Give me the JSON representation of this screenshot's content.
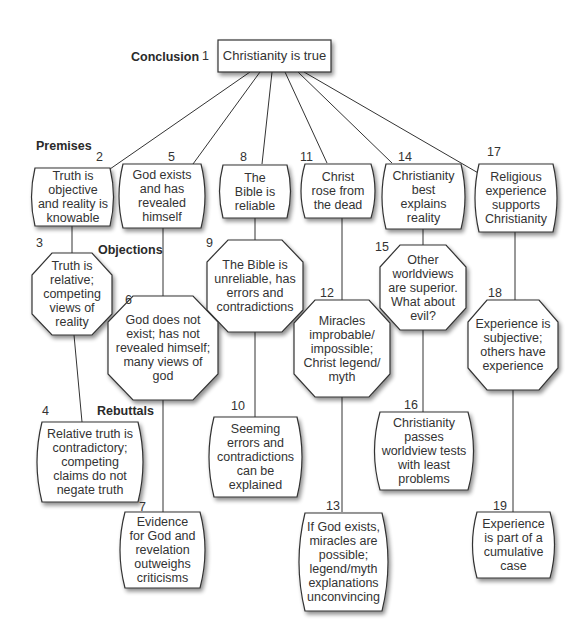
{
  "sections": {
    "conclusion": "Conclusion",
    "premises": "Premises",
    "objections": "Objections",
    "rebuttals": "Rebuttals"
  },
  "nodes": {
    "n1": {
      "number": "1",
      "type": "conclusion",
      "text": "Christianity is true"
    },
    "n2": {
      "number": "2",
      "type": "premise",
      "text": "Truth is objective and reality is knowable"
    },
    "n3": {
      "number": "3",
      "type": "objection",
      "text": "Truth is relative; competing views of reality"
    },
    "n4": {
      "number": "4",
      "type": "rebuttal",
      "text": "Relative truth is contradictory; competing claims do not negate truth"
    },
    "n5": {
      "number": "5",
      "type": "premise",
      "text": "God exists and has revealed himself"
    },
    "n6": {
      "number": "6",
      "type": "objection",
      "text": "God does not exist; has not revealed himself; many views of god"
    },
    "n7": {
      "number": "7",
      "type": "rebuttal",
      "text": "Evidence for God and revelation outweighs criticisms"
    },
    "n8": {
      "number": "8",
      "type": "premise",
      "text": "The Bible is reliable"
    },
    "n9": {
      "number": "9",
      "type": "objection",
      "text": "The Bible is unreliable, has errors and contradictions"
    },
    "n10": {
      "number": "10",
      "type": "rebuttal",
      "text": "Seeming errors and contradictions can be explained"
    },
    "n11": {
      "number": "11",
      "type": "premise",
      "text": "Christ rose from the dead"
    },
    "n12": {
      "number": "12",
      "type": "objection",
      "text": "Miracles improbable/ impossible; Christ legend/ myth"
    },
    "n13": {
      "number": "13",
      "type": "rebuttal",
      "text": "If God exists, miracles are possible; legend/myth explanations unconvincing"
    },
    "n14": {
      "number": "14",
      "type": "premise",
      "text": "Christianity best explains reality"
    },
    "n15": {
      "number": "15",
      "type": "objection",
      "text": "Other worldviews are superior. What about evil?"
    },
    "n16": {
      "number": "16",
      "type": "rebuttal",
      "text": "Christianity passes worldview tests with least problems"
    },
    "n17": {
      "number": "17",
      "type": "premise",
      "text": "Religious experience supports Christianity"
    },
    "n18": {
      "number": "18",
      "type": "objection",
      "text": "Experience is subjective; others have experience"
    },
    "n19": {
      "number": "19",
      "type": "rebuttal",
      "text": "Experience is part of a cumulative case"
    }
  },
  "edges": [
    [
      "n1",
      "n2"
    ],
    [
      "n1",
      "n5"
    ],
    [
      "n1",
      "n8"
    ],
    [
      "n1",
      "n11"
    ],
    [
      "n1",
      "n14"
    ],
    [
      "n1",
      "n17"
    ],
    [
      "n2",
      "n3"
    ],
    [
      "n3",
      "n4"
    ],
    [
      "n5",
      "n6"
    ],
    [
      "n6",
      "n7"
    ],
    [
      "n8",
      "n9"
    ],
    [
      "n9",
      "n10"
    ],
    [
      "n11",
      "n12"
    ],
    [
      "n12",
      "n13"
    ],
    [
      "n14",
      "n15"
    ],
    [
      "n15",
      "n16"
    ],
    [
      "n17",
      "n18"
    ],
    [
      "n18",
      "n19"
    ]
  ],
  "colors": {
    "stroke": "#333333",
    "fill": "#ffffff",
    "shadow": "#9a9a9a"
  }
}
